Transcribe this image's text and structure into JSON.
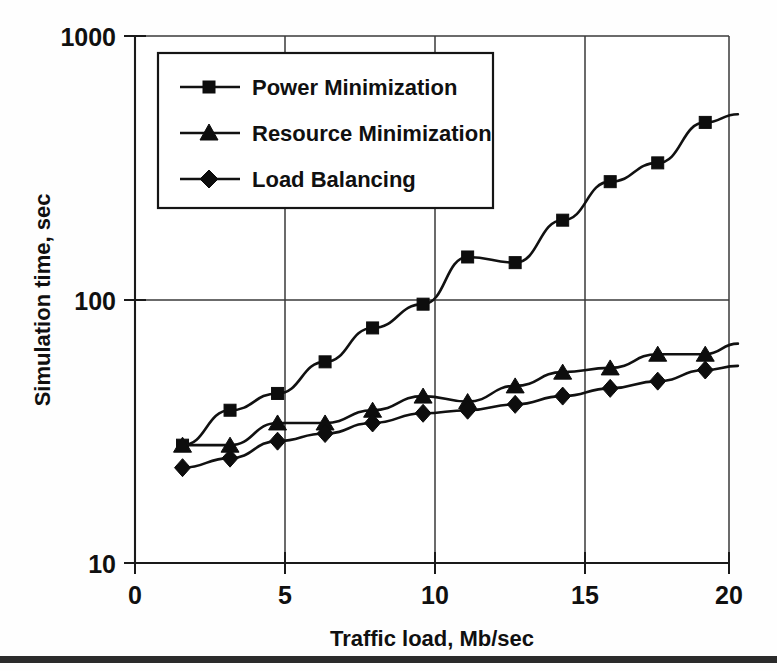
{
  "chart_data": {
    "type": "line",
    "title": "",
    "xlabel": "Traffic load, Mb/sec",
    "ylabel": "Simulation time, sec",
    "xlim": [
      0,
      20
    ],
    "ylim": [
      10,
      1000
    ],
    "yscale": "log",
    "xscale": "linear",
    "grid": true,
    "legend_position": "top-left-inside",
    "xticks": [
      "0",
      "5",
      "10",
      "15",
      "20"
    ],
    "xtick_values": [
      0,
      5,
      10,
      15,
      20
    ],
    "yticks": [
      "10",
      "100",
      "1000"
    ],
    "ytick_values": [
      10,
      100,
      1000
    ],
    "series": [
      {
        "name": "Power Minimization",
        "marker": "square",
        "x": [
          1.6,
          3.2,
          4.8,
          6.4,
          8.0,
          9.7,
          11.2,
          12.8,
          14.4,
          16.0,
          17.6,
          19.2,
          20.3
        ],
        "y": [
          28,
          38,
          44,
          58,
          78,
          96,
          145,
          138,
          200,
          280,
          330,
          470,
          505
        ]
      },
      {
        "name": "Resource Minimization",
        "marker": "triangle",
        "x": [
          1.6,
          3.2,
          4.8,
          6.4,
          8.0,
          9.7,
          11.2,
          12.8,
          14.4,
          16.0,
          17.6,
          19.2,
          20.3
        ],
        "y": [
          28,
          28,
          34,
          34,
          38,
          43,
          41,
          47,
          53,
          55,
          62,
          62,
          68
        ]
      },
      {
        "name": "Load Balancing",
        "marker": "diamond",
        "x": [
          1.6,
          3.2,
          4.8,
          6.4,
          8.0,
          9.7,
          11.2,
          12.8,
          14.4,
          16.0,
          17.6,
          19.2,
          20.3
        ],
        "y": [
          23,
          25,
          29,
          31,
          34,
          37,
          38,
          40,
          43,
          46,
          49,
          54,
          56
        ]
      }
    ]
  },
  "legend": {
    "entries": [
      {
        "label": "Power Minimization",
        "marker": "square"
      },
      {
        "label": "Resource Minimization",
        "marker": "triangle"
      },
      {
        "label": "Load Balancing",
        "marker": "diamond"
      }
    ]
  },
  "axes": {
    "x_title": "Traffic load, Mb/sec",
    "y_title": "Simulation time, sec",
    "x_tick_labels": [
      "0",
      "5",
      "10",
      "15",
      "20"
    ],
    "y_tick_labels": [
      "10",
      "100",
      "1000"
    ]
  },
  "colors": {
    "ink": "#111111",
    "grid": "#3a3a3a",
    "background": "#fefefe",
    "bar": "#2b2b2b"
  }
}
